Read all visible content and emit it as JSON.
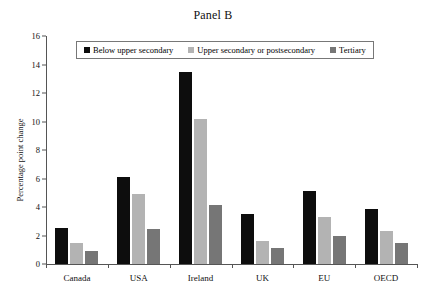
{
  "chart_data": {
    "type": "bar",
    "title": "Panel B",
    "xlabel": "",
    "ylabel": "Percentage point change",
    "categories": [
      "Canada",
      "USA",
      "Ireland",
      "UK",
      "EU",
      "OECD"
    ],
    "ylim": [
      0,
      16
    ],
    "yticks": [
      0,
      2,
      4,
      6,
      8,
      10,
      12,
      14,
      16
    ],
    "grid": false,
    "legend_position": "top-center",
    "series": [
      {
        "name": "Below upper secondary",
        "color": "#0d0d0d",
        "values": [
          2.55,
          6.1,
          13.5,
          3.5,
          5.1,
          3.85
        ]
      },
      {
        "name": "Upper secondary or postsecondary",
        "color": "#b3b3b3",
        "values": [
          1.5,
          4.9,
          10.2,
          1.6,
          3.3,
          2.35
        ]
      },
      {
        "name": "Tertiary",
        "color": "#767676",
        "values": [
          0.9,
          2.45,
          4.15,
          1.1,
          2.0,
          1.5
        ]
      }
    ]
  }
}
